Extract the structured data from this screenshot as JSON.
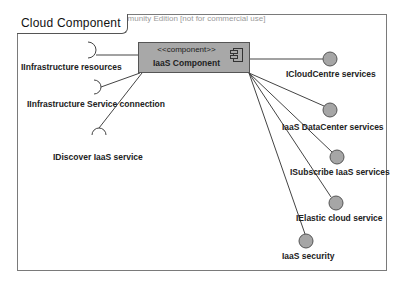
{
  "watermark": "Visual Paradigm for UML Community Edition [not for commercial use]",
  "frame": {
    "title": "Cloud Component"
  },
  "component": {
    "stereotype": "<<component>>",
    "name": "IaaS Component",
    "icon": "component-icon",
    "fill": "#a8a8a8"
  },
  "required_interfaces": [
    {
      "label": "IInfrastructure resources",
      "icon": "socket-icon"
    },
    {
      "label": "IInfrastructure Service connection",
      "icon": "socket-icon"
    },
    {
      "label": "IDiscover IaaS service",
      "icon": "socket-icon"
    }
  ],
  "provided_interfaces": [
    {
      "label": "ICloudCentre services",
      "icon": "lollipop-icon"
    },
    {
      "label": "IaaS DataCenter services",
      "icon": "lollipop-icon"
    },
    {
      "label": "ISubscribe IaaS services",
      "icon": "lollipop-icon"
    },
    {
      "label": "IElastic cloud service",
      "icon": "lollipop-icon"
    },
    {
      "label": "IaaS security",
      "icon": "lollipop-icon"
    }
  ],
  "colors": {
    "lollipop_fill": "#a6a6a6",
    "line": "#444444"
  }
}
